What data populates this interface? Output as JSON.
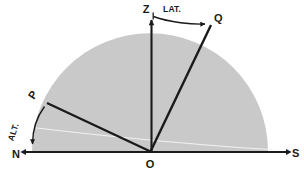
{
  "figure": {
    "type": "astronomical-diagram",
    "background_color": "#ffffff",
    "ink_color": "#1a1a1a",
    "dome_color": "#c9c9c9",
    "equator_color": "#f2f2f2"
  },
  "labels": {
    "zenith": "Z",
    "pole": "Q",
    "star": "P",
    "origin": "O",
    "north": "N",
    "south": "S",
    "latitude_angle": "LAT.",
    "altitude_angle": "ALT."
  },
  "geometry": {
    "center": {
      "x": 150,
      "y": 152
    },
    "dome_radius": 118,
    "horizon": {
      "x1": 22,
      "y1": 152,
      "x2": 290,
      "y2": 152
    },
    "zenith_point": {
      "x": 152,
      "y": 18
    },
    "pole_point": {
      "x": 212,
      "y": 24
    },
    "star_point": {
      "x": 48,
      "y": 102
    }
  },
  "icons": {
    "arrow_north": "arrow-left",
    "arrow_south": "arrow-right",
    "arrow_zenith": "arrow-up",
    "arrow_latitude": "arc-arrow-right",
    "arrow_altitude": "arc-arrow-down"
  }
}
